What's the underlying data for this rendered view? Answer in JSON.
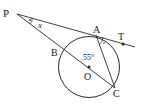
{
  "figure": {
    "points": {
      "P": "P",
      "A": "A",
      "T": "T",
      "B": "B",
      "O": "O",
      "C": "C"
    },
    "angle_labels": {
      "x": "x",
      "angle_OAC": "55°"
    },
    "colors": {
      "stroke": "#2a2a2a",
      "background": "#ffffff"
    }
  }
}
